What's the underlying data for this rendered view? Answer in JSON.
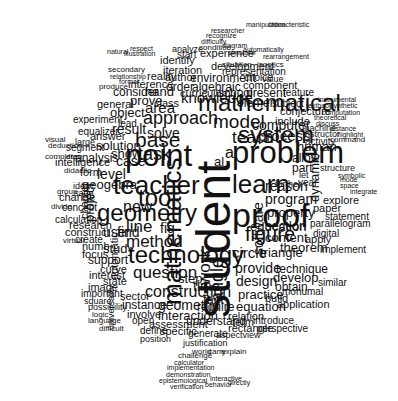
{
  "color": "#111111",
  "background": "#ffffff",
  "words": [
    {
      "t": "student",
      "x": 228,
      "y": 318,
      "s": 48,
      "r": 1
    },
    {
      "t": "mathematics",
      "x": 180,
      "y": 305,
      "s": 26,
      "r": 1
    },
    {
      "t": "proof",
      "x": 232,
      "y": 225,
      "s": 34
    },
    {
      "t": "problem",
      "x": 232,
      "y": 162,
      "s": 31
    },
    {
      "t": "learn",
      "x": 232,
      "y": 192,
      "s": 26
    },
    {
      "t": "point",
      "x": 125,
      "y": 165,
      "s": 31
    },
    {
      "t": "teacher",
      "x": 113,
      "y": 193,
      "s": 26
    },
    {
      "t": "system",
      "x": 238,
      "y": 142,
      "s": 24
    },
    {
      "t": "mathematical",
      "x": 198,
      "y": 110,
      "s": 24
    },
    {
      "t": "geometry",
      "x": 97,
      "y": 220,
      "s": 24
    },
    {
      "t": "technology",
      "x": 128,
      "y": 262,
      "s": 24
    },
    {
      "t": "tool",
      "x": 138,
      "y": 205,
      "s": 24
    },
    {
      "t": "figure",
      "x": 245,
      "y": 240,
      "s": 20
    },
    {
      "t": "model",
      "x": 213,
      "y": 127,
      "s": 19
    },
    {
      "t": "teach",
      "x": 232,
      "y": 143,
      "s": 17
    },
    {
      "t": "base",
      "x": 135,
      "y": 146,
      "s": 21
    },
    {
      "t": "task",
      "x": 138,
      "y": 159,
      "s": 18
    },
    {
      "t": "approach",
      "x": 143,
      "y": 123,
      "s": 18
    },
    {
      "t": "method",
      "x": 126,
      "y": 247,
      "s": 17
    },
    {
      "t": "line",
      "x": 126,
      "y": 232,
      "s": 17
    },
    {
      "t": "fig",
      "x": 160,
      "y": 232,
      "s": 14
    },
    {
      "t": "question",
      "x": 133,
      "y": 278,
      "s": 17
    },
    {
      "t": "construction",
      "x": 145,
      "y": 297,
      "s": 16
    },
    {
      "t": "area",
      "x": 145,
      "y": 112,
      "s": 15
    },
    {
      "t": "knowledge",
      "x": 181,
      "y": 102,
      "s": 15
    },
    {
      "t": "circle",
      "x": 232,
      "y": 257,
      "s": 15
    },
    {
      "t": "triangle",
      "x": 260,
      "y": 256,
      "s": 13
    },
    {
      "t": "provide",
      "x": 235,
      "y": 272,
      "s": 14
    },
    {
      "t": "design",
      "x": 236,
      "y": 285,
      "s": 14
    },
    {
      "t": "process",
      "x": 258,
      "y": 140,
      "s": 15
    },
    {
      "t": "computer",
      "x": 252,
      "y": 129,
      "s": 14
    },
    {
      "t": "program",
      "x": 265,
      "y": 203,
      "s": 14
    },
    {
      "t": "property",
      "x": 267,
      "y": 216,
      "s": 13
    },
    {
      "t": "section",
      "x": 265,
      "y": 229,
      "s": 13
    },
    {
      "t": "content",
      "x": 265,
      "y": 241,
      "s": 13
    },
    {
      "t": "education",
      "x": 250,
      "y": 230,
      "s": 13
    },
    {
      "t": "reason",
      "x": 265,
      "y": 190,
      "s": 14
    },
    {
      "t": "human",
      "x": 297,
      "y": 150,
      "s": 13
    },
    {
      "t": "allow",
      "x": 292,
      "y": 162,
      "s": 12
    },
    {
      "t": "part",
      "x": 292,
      "y": 172,
      "s": 12
    },
    {
      "t": "ai",
      "x": 225,
      "y": 158,
      "s": 16
    },
    {
      "t": "al",
      "x": 214,
      "y": 165,
      "s": 13
    },
    {
      "t": "result",
      "x": 112,
      "y": 133,
      "s": 14
    },
    {
      "t": "solve",
      "x": 147,
      "y": 137,
      "s": 14
    },
    {
      "t": "solution",
      "x": 96,
      "y": 149,
      "s": 13
    },
    {
      "t": "show",
      "x": 111,
      "y": 157,
      "s": 13
    },
    {
      "t": "case",
      "x": 116,
      "y": 165,
      "s": 14
    },
    {
      "t": "level",
      "x": 97,
      "y": 178,
      "s": 14
    },
    {
      "t": "geogebra",
      "x": 82,
      "y": 188,
      "s": 13
    },
    {
      "t": "intelligence",
      "x": 55,
      "y": 166,
      "s": 11
    },
    {
      "t": "analysis",
      "x": 75,
      "y": 162,
      "s": 12
    },
    {
      "t": "form",
      "x": 80,
      "y": 176,
      "s": 11
    },
    {
      "t": "new",
      "x": 123,
      "y": 212,
      "s": 16
    },
    {
      "t": "user",
      "x": 103,
      "y": 236,
      "s": 14
    },
    {
      "t": "find",
      "x": 117,
      "y": 236,
      "s": 14
    },
    {
      "t": "study",
      "x": 103,
      "y": 252,
      "s": 13
    },
    {
      "t": "support",
      "x": 88,
      "y": 264,
      "s": 12
    },
    {
      "t": "curve",
      "x": 100,
      "y": 273,
      "s": 11
    },
    {
      "t": "interest",
      "x": 89,
      "y": 279,
      "s": 11
    },
    {
      "t": "state",
      "x": 103,
      "y": 285,
      "s": 11
    },
    {
      "t": "image",
      "x": 88,
      "y": 291,
      "s": 11
    },
    {
      "t": "time",
      "x": 193,
      "y": 290,
      "s": 14
    },
    {
      "t": "step",
      "x": 178,
      "y": 282,
      "s": 13
    },
    {
      "t": "sector",
      "x": 120,
      "y": 300,
      "s": 11
    },
    {
      "t": "instance",
      "x": 122,
      "y": 309,
      "s": 12
    },
    {
      "t": "geometric",
      "x": 158,
      "y": 309,
      "s": 14
    },
    {
      "t": "interaction",
      "x": 158,
      "y": 319,
      "s": 13
    },
    {
      "t": "involve",
      "x": 127,
      "y": 318,
      "s": 11
    },
    {
      "t": "require",
      "x": 197,
      "y": 311,
      "s": 12
    },
    {
      "t": "understand",
      "x": 186,
      "y": 325,
      "s": 12
    },
    {
      "t": "assessment",
      "x": 149,
      "y": 328,
      "s": 11
    },
    {
      "t": "specific",
      "x": 160,
      "y": 335,
      "s": 11
    },
    {
      "t": "define",
      "x": 140,
      "y": 334,
      "s": 10
    },
    {
      "t": "open",
      "x": 132,
      "y": 324,
      "s": 10
    },
    {
      "t": "fact",
      "x": 203,
      "y": 303,
      "s": 13
    },
    {
      "t": "work",
      "x": 210,
      "y": 285,
      "s": 17,
      "r": 1
    },
    {
      "t": "angle",
      "x": 222,
      "y": 302,
      "s": 18,
      "r": 1
    },
    {
      "t": "equation",
      "x": 236,
      "y": 310,
      "s": 13
    },
    {
      "t": "practice",
      "x": 238,
      "y": 298,
      "s": 13
    },
    {
      "t": "build",
      "x": 265,
      "y": 302,
      "s": 11
    },
    {
      "t": "monumal",
      "x": 282,
      "y": 295,
      "s": 10
    },
    {
      "t": "application",
      "x": 277,
      "y": 308,
      "s": 11
    },
    {
      "t": "relation",
      "x": 228,
      "y": 320,
      "s": 11
    },
    {
      "t": "term",
      "x": 232,
      "y": 326,
      "s": 11
    },
    {
      "t": "introduce",
      "x": 253,
      "y": 324,
      "s": 10
    },
    {
      "t": "rectangle",
      "x": 228,
      "y": 332,
      "s": 11
    },
    {
      "t": "perspective",
      "x": 257,
      "y": 332,
      "s": 10
    },
    {
      "t": "develop",
      "x": 273,
      "y": 281,
      "s": 13
    },
    {
      "t": "technique",
      "x": 276,
      "y": 273,
      "s": 12
    },
    {
      "t": "theorem",
      "x": 280,
      "y": 251,
      "s": 13
    },
    {
      "t": "obtain",
      "x": 275,
      "y": 291,
      "s": 12
    },
    {
      "t": "software",
      "x": 262,
      "y": 255,
      "s": 14,
      "r": 1
    },
    {
      "t": "dynamic",
      "x": 318,
      "y": 202,
      "s": 13,
      "r": 1
    },
    {
      "t": "explore",
      "x": 323,
      "y": 204,
      "s": 11
    },
    {
      "t": "paper",
      "x": 313,
      "y": 212,
      "s": 11
    },
    {
      "t": "statement",
      "x": 325,
      "y": 220,
      "s": 10
    },
    {
      "t": "parallelogram",
      "x": 310,
      "y": 227,
      "s": 10
    },
    {
      "t": "digital",
      "x": 313,
      "y": 237,
      "s": 10
    },
    {
      "t": "apply",
      "x": 305,
      "y": 243,
      "s": 11
    },
    {
      "t": "implement",
      "x": 320,
      "y": 253,
      "s": 10
    },
    {
      "t": "similar",
      "x": 318,
      "y": 286,
      "s": 10
    },
    {
      "t": "experience",
      "x": 200,
      "y": 57,
      "s": 11
    },
    {
      "t": "development",
      "x": 211,
      "y": 70,
      "s": 11
    },
    {
      "t": "iteration",
      "x": 163,
      "y": 74,
      "s": 11
    },
    {
      "t": "author",
      "x": 165,
      "y": 81,
      "s": 11
    },
    {
      "t": "environment",
      "x": 190,
      "y": 82,
      "s": 12
    },
    {
      "t": "algebraic",
      "x": 192,
      "y": 91,
      "s": 12
    },
    {
      "t": "order",
      "x": 166,
      "y": 91,
      "s": 12
    },
    {
      "t": "curriculum",
      "x": 180,
      "y": 97,
      "s": 11
    },
    {
      "t": "school",
      "x": 218,
      "y": 97,
      "s": 12
    },
    {
      "t": "present",
      "x": 246,
      "y": 97,
      "s": 12
    },
    {
      "t": "component",
      "x": 243,
      "y": 89,
      "s": 11
    },
    {
      "t": "element",
      "x": 237,
      "y": 107,
      "s": 12
    },
    {
      "t": "subject",
      "x": 272,
      "y": 107,
      "s": 10
    },
    {
      "t": "conjecture",
      "x": 280,
      "y": 115,
      "s": 11
    },
    {
      "t": "include",
      "x": 275,
      "y": 125,
      "s": 11
    },
    {
      "t": "representation",
      "x": 222,
      "y": 75,
      "s": 10
    },
    {
      "t": "feature",
      "x": 283,
      "y": 96,
      "s": 10
    },
    {
      "t": "choice",
      "x": 244,
      "y": 81,
      "s": 10
    },
    {
      "t": "value",
      "x": 262,
      "y": 82,
      "s": 9
    },
    {
      "t": "identify",
      "x": 160,
      "y": 64,
      "s": 11
    },
    {
      "t": "start",
      "x": 177,
      "y": 58,
      "s": 10
    },
    {
      "t": "analyze",
      "x": 172,
      "y": 52,
      "s": 9
    },
    {
      "t": "reality",
      "x": 147,
      "y": 80,
      "s": 11
    },
    {
      "t": "inference",
      "x": 128,
      "y": 88,
      "s": 11
    },
    {
      "t": "hand",
      "x": 145,
      "y": 95,
      "s": 13
    },
    {
      "t": "consider",
      "x": 113,
      "y": 96,
      "s": 12
    },
    {
      "t": "prove",
      "x": 130,
      "y": 104,
      "s": 13
    },
    {
      "t": "class",
      "x": 154,
      "y": 107,
      "s": 11
    },
    {
      "t": "object",
      "x": 110,
      "y": 116,
      "s": 13
    },
    {
      "t": "lead",
      "x": 118,
      "y": 127,
      "s": 10
    },
    {
      "t": "general",
      "x": 97,
      "y": 108,
      "s": 11
    },
    {
      "t": "experiment",
      "x": 73,
      "y": 123,
      "s": 10
    },
    {
      "t": "equalizer",
      "x": 78,
      "y": 135,
      "s": 10
    },
    {
      "t": "answer",
      "x": 90,
      "y": 140,
      "s": 11
    },
    {
      "t": "segment",
      "x": 66,
      "y": 151,
      "s": 10
    },
    {
      "t": "large",
      "x": 75,
      "y": 145,
      "s": 9
    },
    {
      "t": "change",
      "x": 59,
      "y": 201,
      "s": 11
    },
    {
      "t": "concept",
      "x": 62,
      "y": 211,
      "s": 10
    },
    {
      "t": "calculation",
      "x": 55,
      "y": 223,
      "s": 10
    },
    {
      "t": "research",
      "x": 69,
      "y": 229,
      "s": 11
    },
    {
      "t": "construct",
      "x": 65,
      "y": 236,
      "s": 11
    },
    {
      "t": "create",
      "x": 75,
      "y": 243,
      "s": 10
    },
    {
      "t": "numb",
      "x": 82,
      "y": 250,
      "s": 11
    },
    {
      "t": "focus",
      "x": 82,
      "y": 258,
      "s": 11
    },
    {
      "t": "project",
      "x": 93,
      "y": 222,
      "s": 13,
      "r": 1
    },
    {
      "t": "chapter",
      "x": 88,
      "y": 219,
      "s": 11,
      "r": 1
    },
    {
      "t": "automatic",
      "x": 118,
      "y": 280,
      "s": 11,
      "r": 1
    },
    {
      "t": "universality",
      "x": 114,
      "y": 330,
      "s": 9,
      "r": 1
    },
    {
      "t": "important",
      "x": 81,
      "y": 297,
      "s": 10
    },
    {
      "t": "square",
      "x": 84,
      "y": 304,
      "s": 9
    },
    {
      "t": "possibility",
      "x": 88,
      "y": 310,
      "s": 9
    },
    {
      "t": "logic",
      "x": 92,
      "y": 317,
      "s": 8
    },
    {
      "t": "language",
      "x": 88,
      "y": 323,
      "s": 8
    },
    {
      "t": "difficult",
      "x": 99,
      "y": 331,
      "s": 8
    },
    {
      "t": "position",
      "x": 140,
      "y": 342,
      "s": 9
    },
    {
      "t": "justification",
      "x": 183,
      "y": 346,
      "s": 9
    },
    {
      "t": "generate",
      "x": 188,
      "y": 337,
      "s": 10
    },
    {
      "t": "aspectview",
      "x": 216,
      "y": 338,
      "s": 9
    },
    {
      "t": "world",
      "x": 192,
      "y": 354,
      "s": 8
    },
    {
      "t": "carry",
      "x": 208,
      "y": 354,
      "s": 8
    },
    {
      "t": "explain",
      "x": 221,
      "y": 354,
      "s": 8
    },
    {
      "t": "challenge",
      "x": 178,
      "y": 358,
      "s": 8
    },
    {
      "t": "implementation",
      "x": 167,
      "y": 370,
      "s": 7
    },
    {
      "t": "calculator",
      "x": 174,
      "y": 365,
      "s": 7
    },
    {
      "t": "demonstration",
      "x": 166,
      "y": 377,
      "s": 7
    },
    {
      "t": "epistemological",
      "x": 159,
      "y": 383,
      "s": 7
    },
    {
      "t": "verification",
      "x": 170,
      "y": 389,
      "s": 7
    },
    {
      "t": "interactive",
      "x": 210,
      "y": 381,
      "s": 7
    },
    {
      "t": "behavior",
      "x": 205,
      "y": 387,
      "s": 7
    },
    {
      "t": "directly",
      "x": 228,
      "y": 385,
      "s": 7
    },
    {
      "t": "visual",
      "x": 45,
      "y": 142,
      "s": 8
    },
    {
      "t": "deduction",
      "x": 48,
      "y": 148,
      "s": 8
    },
    {
      "t": "complete",
      "x": 45,
      "y": 159,
      "s": 8
    },
    {
      "t": "drag",
      "x": 66,
      "y": 159,
      "s": 8
    },
    {
      "t": "didactic",
      "x": 64,
      "y": 173,
      "s": 8
    },
    {
      "t": "idea",
      "x": 73,
      "y": 189,
      "s": 9
    },
    {
      "t": "sage",
      "x": 74,
      "y": 196,
      "s": 9
    },
    {
      "t": "group",
      "x": 57,
      "y": 194,
      "s": 8
    },
    {
      "t": "divide",
      "x": 51,
      "y": 209,
      "s": 8
    },
    {
      "t": "virtual",
      "x": 63,
      "y": 243,
      "s": 8
    },
    {
      "t": "instrumental",
      "x": 318,
      "y": 102,
      "s": 7
    },
    {
      "t": "textbook",
      "x": 306,
      "y": 108,
      "s": 7
    },
    {
      "t": "synthetic",
      "x": 330,
      "y": 108,
      "s": 7
    },
    {
      "t": "computation",
      "x": 322,
      "y": 115,
      "s": 7
    },
    {
      "t": "theoretical",
      "x": 314,
      "y": 120,
      "s": 7
    },
    {
      "t": "discuss",
      "x": 316,
      "y": 126,
      "s": 7
    },
    {
      "t": "machine",
      "x": 302,
      "y": 131,
      "s": 9
    },
    {
      "t": "instructor",
      "x": 303,
      "y": 137,
      "s": 9
    },
    {
      "t": "distance",
      "x": 330,
      "y": 131,
      "s": 7
    },
    {
      "t": "highlight",
      "x": 337,
      "y": 137,
      "s": 7
    },
    {
      "t": "activity",
      "x": 305,
      "y": 145,
      "s": 10
    },
    {
      "t": "command",
      "x": 330,
      "y": 142,
      "s": 8
    },
    {
      "t": "structure",
      "x": 320,
      "y": 171,
      "s": 9
    },
    {
      "t": "symbolic",
      "x": 338,
      "y": 178,
      "s": 7
    },
    {
      "t": "integrate",
      "x": 350,
      "y": 194,
      "s": 7
    },
    {
      "t": "space",
      "x": 340,
      "y": 188,
      "s": 7
    },
    {
      "t": "mode",
      "x": 340,
      "y": 182,
      "s": 7
    },
    {
      "t": "year",
      "x": 298,
      "y": 186,
      "s": 10
    },
    {
      "t": "let",
      "x": 299,
      "y": 178,
      "s": 9
    },
    {
      "t": "further",
      "x": 275,
      "y": 187,
      "s": 9
    },
    {
      "t": "manipulation",
      "x": 246,
      "y": 27,
      "s": 7
    },
    {
      "t": "characteristic",
      "x": 268,
      "y": 27,
      "s": 7
    },
    {
      "t": "researcher",
      "x": 211,
      "y": 33,
      "s": 7
    },
    {
      "t": "recognize",
      "x": 206,
      "y": 38,
      "s": 7
    },
    {
      "t": "difficulty",
      "x": 201,
      "y": 44,
      "s": 7
    },
    {
      "t": "condition",
      "x": 199,
      "y": 50,
      "s": 8
    },
    {
      "t": "diagram",
      "x": 222,
      "y": 48,
      "s": 7
    },
    {
      "t": "simulator",
      "x": 228,
      "y": 55,
      "s": 7
    },
    {
      "t": "automatically",
      "x": 243,
      "y": 52,
      "s": 7
    },
    {
      "t": "rearrangement",
      "x": 263,
      "y": 59,
      "s": 7
    },
    {
      "t": "situation",
      "x": 222,
      "y": 67,
      "s": 8
    },
    {
      "t": "isoptics",
      "x": 257,
      "y": 67,
      "s": 8
    },
    {
      "t": "relationship",
      "x": 110,
      "y": 79,
      "s": 7
    },
    {
      "t": "formal",
      "x": 119,
      "y": 84,
      "s": 7
    },
    {
      "t": "produce",
      "x": 99,
      "y": 89,
      "s": 8
    },
    {
      "t": "secondary",
      "x": 108,
      "y": 72,
      "s": 8
    },
    {
      "t": "natural",
      "x": 107,
      "y": 54,
      "s": 7
    },
    {
      "t": "respect",
      "x": 130,
      "y": 51,
      "s": 7
    },
    {
      "t": "illustration",
      "x": 124,
      "y": 56,
      "s": 7
    }
  ]
}
